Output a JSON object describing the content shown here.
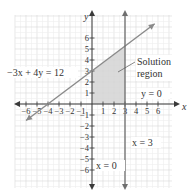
{
  "chart_data": {
    "type": "line",
    "title": "",
    "xlabel": "x",
    "ylabel": "y",
    "xlim": [
      -7,
      7
    ],
    "ylim": [
      -7,
      8
    ],
    "grid": true,
    "x_ticks": [
      -6,
      -5,
      -4,
      -3,
      -2,
      -1,
      1,
      2,
      3,
      4,
      5,
      6
    ],
    "y_ticks": [
      -6,
      -5,
      -4,
      -3,
      -2,
      -1,
      1,
      2,
      3,
      4,
      5,
      6
    ],
    "x_tick_labels": [
      "−6",
      "−5",
      "−4",
      "−3",
      "−2",
      "−1",
      "1",
      "2",
      "3",
      "4",
      "5",
      "6"
    ],
    "y_tick_labels": [
      "−6",
      "−5",
      "−4",
      "−3",
      "−2",
      "−1",
      "1",
      "2",
      "3",
      "4",
      "5",
      "6"
    ],
    "series": [
      {
        "name": "−3x + 4y = 12",
        "kind": "line",
        "points": [
          [
            -6,
            -1.5
          ],
          [
            -4,
            0
          ],
          [
            0,
            3
          ],
          [
            3,
            5.25
          ],
          [
            5.7,
            7.3
          ]
        ]
      },
      {
        "name": "x = 3",
        "kind": "vertical",
        "x": 3,
        "y_range": [
          -7.5,
          8.3
        ]
      },
      {
        "name": "y = 0",
        "kind": "boundary",
        "note": "x-axis"
      },
      {
        "name": "x = 0",
        "kind": "boundary",
        "note": "y-axis"
      }
    ],
    "shaded_region": {
      "name": "Solution region",
      "vertices": [
        [
          0,
          0
        ],
        [
          3,
          0
        ],
        [
          3,
          5.25
        ],
        [
          0,
          3
        ]
      ],
      "fill": "#d4d4d4"
    },
    "annotations": [
      {
        "text": "−3x + 4y = 12",
        "at": [
          -4.5,
          3
        ]
      },
      {
        "text": "Solution",
        "at": [
          4,
          4
        ]
      },
      {
        "text": "region",
        "at": [
          4,
          3
        ]
      },
      {
        "text": "y = 0",
        "at": [
          4.5,
          0.6
        ]
      },
      {
        "text": "x = 3",
        "at": [
          3.5,
          -3.5
        ]
      },
      {
        "text": "x = 0",
        "at": [
          0.3,
          -5.3
        ]
      }
    ]
  },
  "labels": {
    "axis_x": "x",
    "axis_y": "y",
    "line_eq": "−3x + 4y = 12",
    "solution_1": "Solution",
    "solution_2": "region",
    "y0": "y = 0",
    "x3": "x = 3",
    "x0": "x = 0"
  },
  "colors": {
    "line": "#8a8a8a",
    "axis": "#3a3a3a",
    "grid_major": "#d8d8d8",
    "grid_minor": "#eeeeee",
    "shade": "#d4d4d4",
    "vertical": "#6f6f6f"
  }
}
